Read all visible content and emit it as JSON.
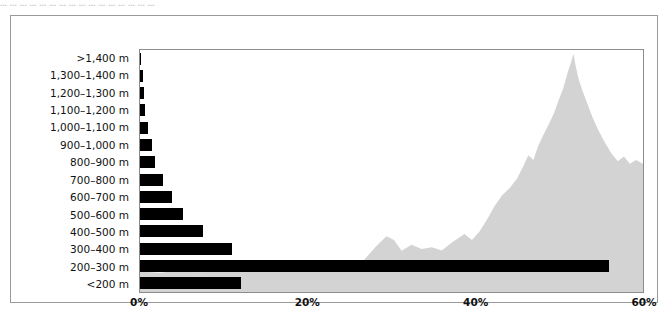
{
  "caption": {
    "text": "… … … … … … … … … … … … … … … …"
  },
  "colors": {
    "bar": "#000000",
    "terrain": "#d3d3d3",
    "plot_border": "#8c8c8c",
    "outer_border": "#9a9a9a",
    "background": "#ffffff",
    "text": "#111111"
  },
  "chart_data": {
    "type": "bar",
    "orientation": "horizontal",
    "title": "",
    "subtitle": "",
    "xlabel": "",
    "ylabel": "",
    "xlim": [
      0,
      60
    ],
    "ylim": null,
    "grid": false,
    "legend": null,
    "x_tick_labels": [
      "0%",
      "20%",
      "40%",
      "60%"
    ],
    "x_tick_values": [
      0,
      20,
      40,
      60
    ],
    "categories": [
      ">1,400 m",
      "1,300–1,400 m",
      "1,200–1,300 m",
      "1,100–1,200 m",
      "1,000–1,100 m",
      "900–1,000 m",
      "800–900 m",
      "700–800 m",
      "600–700 m",
      "500–600 m",
      "400–500 m",
      "300–400 m",
      "200–300 m",
      "<200 m"
    ],
    "values": [
      0.1,
      0.3,
      0.5,
      0.6,
      1.0,
      1.4,
      1.8,
      2.8,
      3.8,
      5.1,
      7.5,
      11.0,
      56.0,
      12.0
    ],
    "value_unit": "%",
    "annotations": [
      {
        "name": "terrain-silhouette",
        "description": "light grey mountain profile silhouette filling the plot background, rising from a low plateau on the left to a sharp peak near the right edge",
        "fill": "#d3d3d3"
      }
    ]
  }
}
